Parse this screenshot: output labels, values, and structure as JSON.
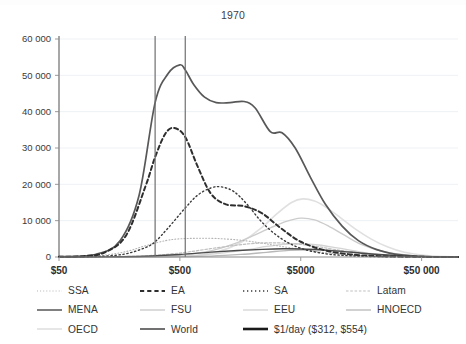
{
  "chart_data": {
    "type": "line",
    "title": "1970",
    "xlabel": "",
    "ylabel": "",
    "xscale": "log",
    "xlim": [
      50,
      100000
    ],
    "ylim": [
      0,
      60000
    ],
    "grid": true,
    "legend_position": "bottom",
    "xtick_labels": [
      "$50",
      "$500",
      "$5000",
      "$50 000"
    ],
    "xtick_values": [
      50,
      500,
      5000,
      50000
    ],
    "ytick_labels": [
      "0",
      "10 000",
      "20 000",
      "30 000",
      "40 000",
      "50 000",
      "60 000"
    ],
    "ytick_values": [
      0,
      10000,
      20000,
      30000,
      40000,
      50000,
      60000
    ],
    "annotations": [
      {
        "label": "$1/day lower bound",
        "x": 312,
        "type": "vline"
      },
      {
        "label": "$1/day upper bound",
        "x": 554,
        "type": "vline"
      }
    ],
    "series": [
      {
        "name": "SSA",
        "style": "dotted",
        "color": "#b4b4b4",
        "width": 1.1,
        "x": [
          50,
          80,
          120,
          180,
          260,
          380,
          500,
          700,
          1000,
          1500,
          2200,
          3200,
          5000,
          8000,
          13000,
          22000,
          40000,
          70000,
          100000
        ],
        "values": [
          60,
          180,
          520,
          1500,
          3100,
          4500,
          5000,
          5150,
          5100,
          4700,
          4000,
          3100,
          2100,
          1200,
          600,
          250,
          90,
          25,
          5
        ]
      },
      {
        "name": "EA",
        "style": "dashed",
        "color": "#2e2e2e",
        "width": 2.0,
        "x": [
          50,
          80,
          120,
          180,
          260,
          312,
          380,
          450,
          554,
          700,
          900,
          1200,
          1700,
          2400,
          3400,
          5000,
          8000,
          13000,
          22000,
          40000,
          70000,
          100000
        ],
        "values": [
          40,
          220,
          1300,
          6000,
          19500,
          27500,
          34000,
          35500,
          33000,
          25000,
          17500,
          14500,
          14000,
          12000,
          8000,
          4200,
          1800,
          700,
          240,
          70,
          15,
          3
        ]
      },
      {
        "name": "SA",
        "style": "dotted",
        "color": "#3a3a3a",
        "width": 1.4,
        "x": [
          50,
          80,
          120,
          180,
          260,
          312,
          400,
          554,
          700,
          900,
          1100,
          1400,
          1800,
          2400,
          3400,
          5000,
          8000,
          13000,
          22000,
          40000,
          70000,
          100000
        ],
        "values": [
          20,
          60,
          250,
          900,
          2600,
          4200,
          8000,
          13500,
          17000,
          19000,
          19300,
          18000,
          14500,
          9500,
          5200,
          2400,
          900,
          320,
          100,
          25,
          5,
          1
        ]
      },
      {
        "name": "Latam",
        "style": "dashed",
        "color": "#bfbfbf",
        "width": 1.2,
        "x": [
          50,
          120,
          260,
          500,
          900,
          1500,
          2200,
          3200,
          4500,
          6500,
          9000,
          13000,
          20000,
          32000,
          55000,
          100000
        ],
        "values": [
          5,
          50,
          320,
          1100,
          2300,
          3300,
          3800,
          3900,
          3600,
          3000,
          2200,
          1400,
          700,
          260,
          60,
          8
        ]
      },
      {
        "name": "MENA",
        "style": "solid",
        "color": "#4a4a4a",
        "width": 1.4,
        "x": [
          50,
          120,
          260,
          500,
          900,
          1500,
          2400,
          3600,
          5200,
          7500,
          11000,
          16000,
          24000,
          38000,
          60000,
          100000
        ],
        "values": [
          5,
          40,
          220,
          700,
          1350,
          1800,
          2100,
          2250,
          2200,
          1950,
          1550,
          1050,
          600,
          250,
          70,
          10
        ]
      },
      {
        "name": "FSU",
        "style": "solid",
        "color": "#cccccc",
        "width": 1.4,
        "x": [
          50,
          200,
          500,
          900,
          1400,
          2000,
          2800,
          3800,
          5000,
          6500,
          8500,
          11500,
          16000,
          24000,
          38000,
          60000,
          100000
        ],
        "values": [
          2,
          60,
          500,
          1700,
          3600,
          5800,
          8000,
          9800,
          10700,
          10200,
          8500,
          6000,
          3400,
          1500,
          480,
          110,
          12
        ]
      },
      {
        "name": "EEU",
        "style": "solid",
        "color": "#d4d4d4",
        "width": 1.3,
        "x": [
          50,
          300,
          700,
          1200,
          1800,
          2600,
          3600,
          5000,
          7000,
          10000,
          15000,
          22000,
          34000,
          55000,
          100000
        ],
        "values": [
          2,
          80,
          450,
          1200,
          2000,
          2900,
          3500,
          3700,
          3300,
          2500,
          1500,
          750,
          280,
          70,
          8
        ]
      },
      {
        "name": "HNOECD",
        "style": "solid",
        "color": "#b8b8b8",
        "width": 1.3,
        "x": [
          50,
          400,
          900,
          1600,
          2600,
          4000,
          6000,
          9000,
          13000,
          19000,
          28000,
          42000,
          65000,
          100000
        ],
        "values": [
          1,
          40,
          260,
          700,
          1300,
          1850,
          2000,
          1800,
          1350,
          850,
          420,
          150,
          40,
          5
        ]
      },
      {
        "name": "OECD",
        "style": "solid",
        "color": "#e0e0e0",
        "width": 1.6,
        "x": [
          50,
          500,
          1000,
          1600,
          2400,
          3200,
          4200,
          5200,
          6500,
          8000,
          10500,
          14000,
          19000,
          26000,
          36000,
          55000,
          80000,
          100000
        ],
        "values": [
          1,
          150,
          1400,
          4000,
          8200,
          12000,
          15000,
          16000,
          15400,
          13800,
          11000,
          7800,
          5000,
          2800,
          1300,
          400,
          90,
          20
        ]
      },
      {
        "name": "World",
        "style": "solid",
        "color": "#585858",
        "width": 1.7,
        "x": [
          50,
          100,
          160,
          230,
          312,
          400,
          500,
          554,
          650,
          800,
          1000,
          1300,
          1700,
          2100,
          2800,
          3500,
          4500,
          6000,
          8000,
          11000,
          15000,
          21000,
          30000,
          45000,
          65000,
          100000
        ],
        "values": [
          100,
          700,
          4500,
          17000,
          42500,
          50500,
          52900,
          51500,
          47500,
          44000,
          42500,
          42500,
          42800,
          41000,
          34500,
          34200,
          30000,
          22000,
          14500,
          8500,
          4500,
          2100,
          800,
          220,
          50,
          8
        ]
      },
      {
        "name": "$1/day ($312, $554)",
        "style": "solid-thick",
        "color": "#1a1a1a",
        "width": 2.6,
        "x": [
          312,
          554
        ],
        "values": [
          0,
          0
        ]
      }
    ]
  },
  "legend": {
    "rows": [
      [
        {
          "label": "SSA",
          "series": "SSA"
        },
        {
          "label": "EA",
          "series": "EA"
        },
        {
          "label": "SA",
          "series": "SA"
        },
        {
          "label": "Latam",
          "series": "Latam"
        }
      ],
      [
        {
          "label": "MENA",
          "series": "MENA"
        },
        {
          "label": "FSU",
          "series": "FSU"
        },
        {
          "label": "EEU",
          "series": "EEU"
        },
        {
          "label": "HNOECD",
          "series": "HNOECD"
        }
      ],
      [
        {
          "label": "OECD",
          "series": "OECD"
        },
        {
          "label": "World",
          "series": "World"
        },
        {
          "label": "$1/day ($312, $554)",
          "series": "$1/day ($312, $554)"
        }
      ]
    ]
  },
  "axes": {
    "axis_color": "#808080",
    "grid_color": "#eef1f5",
    "tick_color": "#9a9a9a"
  }
}
